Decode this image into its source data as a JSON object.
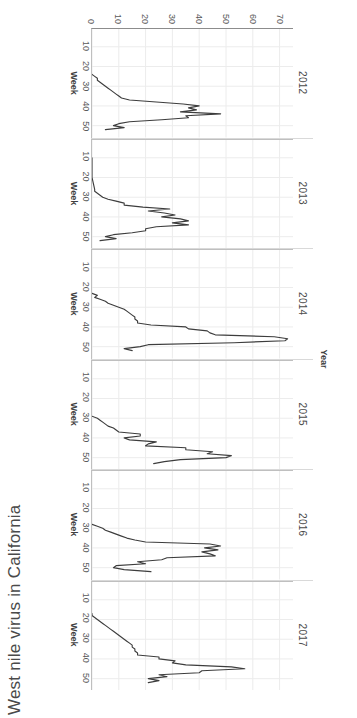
{
  "chart_data": {
    "type": "line",
    "title": "West nile virus in California",
    "xlabel": "Week",
    "ylabel": "Positive Cases",
    "facet_variable": "Year",
    "xlim": [
      1,
      56
    ],
    "ylim": [
      0,
      75
    ],
    "xticks": [
      10,
      20,
      30,
      40,
      50
    ],
    "yticks": [
      0,
      10,
      20,
      30,
      40,
      50,
      60,
      70
    ],
    "grid": true,
    "legend": "none",
    "line_color": "#3d3d3d",
    "facets": [
      {
        "label": "2012",
        "x": [
          24,
          25,
          26,
          27,
          28,
          29,
          30,
          31,
          32,
          33,
          34,
          35,
          36,
          37,
          38,
          39,
          40,
          41,
          42,
          43,
          44,
          45,
          46,
          47,
          48,
          49,
          50,
          51,
          52
        ],
        "y": [
          0,
          1,
          2,
          2,
          3,
          4,
          5,
          6,
          7,
          8,
          9,
          10,
          11,
          14,
          24,
          34,
          40,
          36,
          39,
          33,
          48,
          35,
          36,
          26,
          14,
          10,
          8,
          12,
          5
        ]
      },
      {
        "label": "2013",
        "x": [
          10,
          20,
          26,
          27,
          28,
          29,
          30,
          31,
          32,
          33,
          34,
          35,
          36,
          37,
          38,
          39,
          40,
          41,
          42,
          43,
          44,
          45,
          46,
          47,
          48,
          49,
          50,
          51,
          52
        ],
        "y": [
          0,
          0,
          1,
          1,
          2,
          3,
          4,
          6,
          9,
          12,
          12,
          19,
          29,
          21,
          27,
          31,
          26,
          33,
          36,
          30,
          36,
          24,
          20,
          20,
          15,
          8,
          5,
          9,
          3
        ]
      },
      {
        "label": "2014",
        "x": [
          23,
          24,
          25,
          26,
          27,
          28,
          29,
          30,
          31,
          32,
          33,
          34,
          35,
          36,
          37,
          38,
          39,
          40,
          41,
          42,
          43,
          44,
          45,
          46,
          47,
          48,
          49,
          50,
          51,
          52
        ],
        "y": [
          0,
          2,
          1,
          3,
          5,
          6,
          8,
          10,
          12,
          13,
          14,
          15,
          16,
          16,
          17,
          17,
          22,
          35,
          36,
          43,
          44,
          46,
          68,
          73,
          72,
          53,
          21,
          18,
          12,
          15
        ]
      },
      {
        "label": "2015",
        "x": [
          29,
          30,
          31,
          32,
          33,
          34,
          35,
          36,
          37,
          38,
          39,
          40,
          41,
          42,
          43,
          44,
          45,
          46,
          47,
          48,
          49,
          50,
          51,
          52,
          53
        ],
        "y": [
          0,
          2,
          3,
          4,
          5,
          6,
          8,
          9,
          10,
          18,
          18,
          12,
          14,
          24,
          21,
          20,
          35,
          35,
          45,
          43,
          52,
          50,
          33,
          27,
          23
        ]
      },
      {
        "label": "2016",
        "x": [
          28,
          29,
          30,
          31,
          32,
          33,
          34,
          35,
          36,
          37,
          38,
          39,
          40,
          41,
          42,
          43,
          44,
          45,
          46,
          47,
          48,
          49,
          50,
          51,
          52
        ],
        "y": [
          0,
          2,
          4,
          5,
          7,
          9,
          11,
          13,
          16,
          20,
          44,
          48,
          42,
          47,
          41,
          44,
          46,
          28,
          26,
          17,
          20,
          9,
          8,
          12,
          22
        ]
      },
      {
        "label": "2017",
        "x": [
          17,
          18,
          19,
          20,
          21,
          22,
          23,
          24,
          25,
          26,
          27,
          28,
          29,
          30,
          31,
          32,
          33,
          34,
          35,
          36,
          37,
          38,
          39,
          40,
          41,
          42,
          43,
          44,
          45,
          46,
          47,
          48,
          49,
          50,
          51,
          52
        ],
        "y": [
          0,
          0,
          1,
          2,
          3,
          4,
          5,
          6,
          7,
          8,
          9,
          10,
          11,
          12,
          13,
          14,
          15,
          15,
          16,
          16,
          17,
          17,
          25,
          25,
          31,
          30,
          35,
          52,
          57,
          41,
          40,
          25,
          28,
          21,
          25,
          21
        ]
      }
    ]
  }
}
